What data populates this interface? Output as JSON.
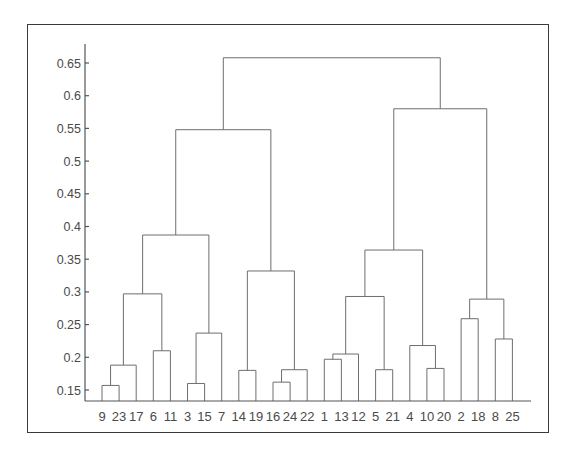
{
  "chart_data": {
    "type": "dendrogram",
    "title": "",
    "xlabel": "",
    "ylabel": "",
    "ylim": [
      0.13,
      0.67
    ],
    "yticks": [
      "0.15",
      "0.2",
      "0.25",
      "0.3",
      "0.35",
      "0.4",
      "0.45",
      "0.5",
      "0.55",
      "0.6",
      "0.65"
    ],
    "ytick_values": [
      0.15,
      0.2,
      0.25,
      0.3,
      0.35,
      0.4,
      0.45,
      0.5,
      0.55,
      0.6,
      0.65
    ],
    "grid": false,
    "leaf_order": [
      "9",
      "23",
      "17",
      "6",
      "11",
      "3",
      "15",
      "7",
      "14",
      "19",
      "16",
      "24",
      "22",
      "1",
      "13",
      "12",
      "5",
      "21",
      "4",
      "10",
      "20",
      "2",
      "18",
      "8",
      "25"
    ],
    "merges": [
      {
        "id": "c1",
        "left": "9",
        "right": "23",
        "height": 0.157
      },
      {
        "id": "c2",
        "left": "c1",
        "right": "17",
        "height": 0.188
      },
      {
        "id": "c3",
        "left": "6",
        "right": "11",
        "height": 0.21
      },
      {
        "id": "c4",
        "left": "c2",
        "right": "c3",
        "height": 0.297
      },
      {
        "id": "c5",
        "left": "3",
        "right": "15",
        "height": 0.16
      },
      {
        "id": "c6",
        "left": "c5",
        "right": "7",
        "height": 0.237
      },
      {
        "id": "c7",
        "left": "c4",
        "right": "c6",
        "height": 0.387
      },
      {
        "id": "c8",
        "left": "14",
        "right": "19",
        "height": 0.18
      },
      {
        "id": "c9",
        "left": "16",
        "right": "24",
        "height": 0.162
      },
      {
        "id": "c10",
        "left": "c9",
        "right": "22",
        "height": 0.181
      },
      {
        "id": "c11",
        "left": "c8",
        "right": "c10",
        "height": 0.332
      },
      {
        "id": "c12",
        "left": "c7",
        "right": "c11",
        "height": 0.548
      },
      {
        "id": "c13",
        "left": "1",
        "right": "13",
        "height": 0.197
      },
      {
        "id": "c14",
        "left": "c13",
        "right": "12",
        "height": 0.205
      },
      {
        "id": "c15",
        "left": "5",
        "right": "21",
        "height": 0.181
      },
      {
        "id": "c16",
        "left": "c14",
        "right": "c15",
        "height": 0.293
      },
      {
        "id": "c17",
        "left": "10",
        "right": "20",
        "height": 0.183
      },
      {
        "id": "c18",
        "left": "4",
        "right": "c17",
        "height": 0.218
      },
      {
        "id": "c19",
        "left": "c16",
        "right": "c18",
        "height": 0.364
      },
      {
        "id": "c20",
        "left": "2",
        "right": "18",
        "height": 0.259
      },
      {
        "id": "c21",
        "left": "8",
        "right": "25",
        "height": 0.228
      },
      {
        "id": "c22",
        "left": "c20",
        "right": "c21",
        "height": 0.289
      },
      {
        "id": "c23",
        "left": "c19",
        "right": "c22",
        "height": 0.58
      },
      {
        "id": "c24",
        "left": "c12",
        "right": "c23",
        "height": 0.658
      }
    ],
    "colors": {
      "links": "#6e6e6e",
      "axis": "#555555",
      "text": "#4a4a4a",
      "frame": "#3a3a3a"
    }
  }
}
